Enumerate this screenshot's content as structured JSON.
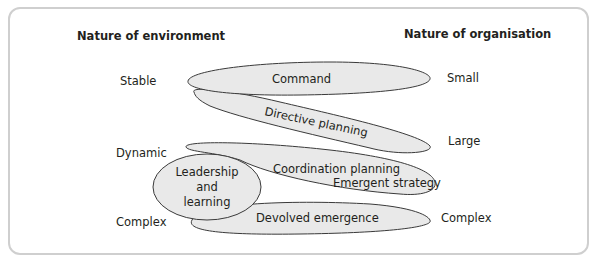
{
  "headers": {
    "left": "Nature of environment",
    "right": "Nature of organisation"
  },
  "environment_labels": [
    "Stable",
    "Dynamic",
    "Complex"
  ],
  "organisation_labels": [
    "Small",
    "Large",
    "Complex"
  ],
  "shapes": {
    "command": "Command",
    "directive_planning": "Directive planning",
    "coordination_planning": "Coordination planning",
    "emergent_strategy": "Emergent strategy",
    "leadership_line1": "Leadership",
    "leadership_line2": "and",
    "leadership_line3": "learning",
    "devolved_emergence": "Devolved emergence"
  },
  "colors": {
    "shape_fill": "#e9e9e9",
    "shape_stroke": "#3a3a3a",
    "frame_border": "#cfcfcf"
  }
}
